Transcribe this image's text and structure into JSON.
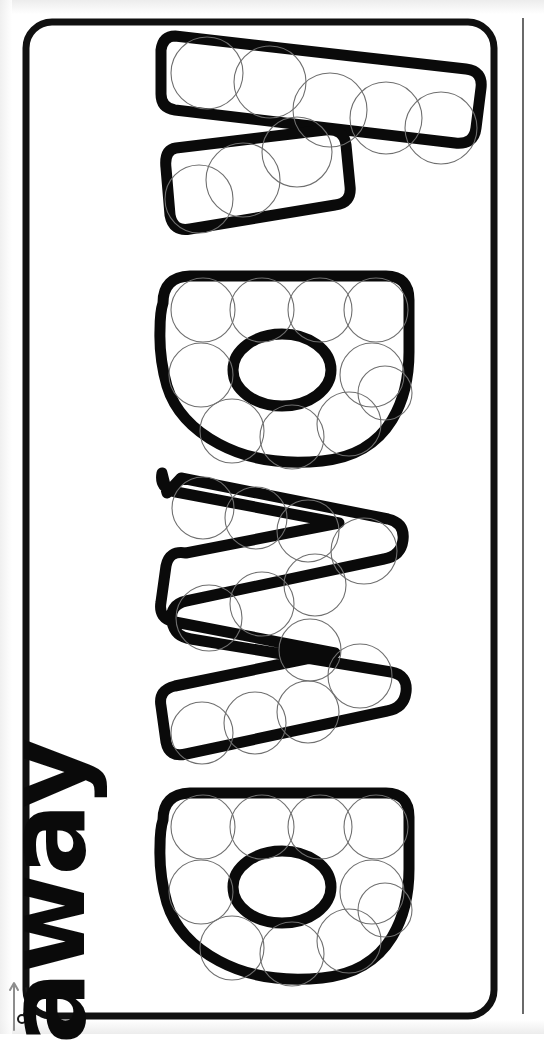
{
  "worksheet": {
    "title": "away",
    "word": "away",
    "word_letters": [
      "a",
      "w",
      "a",
      "y"
    ],
    "orientation": "rotated-90-ccw",
    "page_width": 544,
    "page_height": 1034,
    "ink_color": "#0a0a0a",
    "paper_color": "#ffffff",
    "dot_guide_color": "#6f6f6f"
  },
  "frame": {
    "name": "page-border",
    "shape": "rounded-rectangle",
    "x": 26,
    "y": 22,
    "width": 468,
    "height": 994,
    "corner_radius": 26,
    "stroke_width": 7
  },
  "cut_line": {
    "label": "cut line",
    "x": 523,
    "y_start": 18,
    "y_end": 1014
  },
  "scissors_marker": {
    "name": "scissors-cut-icon",
    "x": 12,
    "y": 990,
    "direction": "up"
  },
  "letters": [
    {
      "id": "letter-y",
      "char": "y",
      "order": 4,
      "dot_count": 8,
      "note": "bubble letter y, top of page when rotated"
    },
    {
      "id": "letter-a-upper",
      "char": "a",
      "order": 3,
      "dot_count": 10,
      "note": "bubble letter a with oval counter"
    },
    {
      "id": "letter-w",
      "char": "w",
      "order": 2,
      "dot_count": 12,
      "note": "bubble letter w, zig-zag"
    },
    {
      "id": "letter-a-lower",
      "char": "a",
      "order": 1,
      "dot_count": 10,
      "note": "bubble letter a with oval counter, bottom of page"
    }
  ],
  "totals": {
    "letter_count": 4,
    "dot_count": 40
  }
}
